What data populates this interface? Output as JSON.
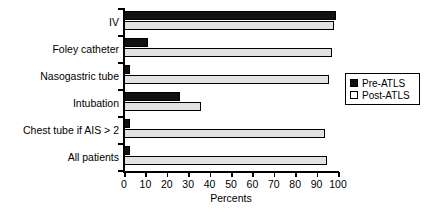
{
  "chart_data": {
    "type": "bar",
    "orientation": "horizontal",
    "title": "",
    "xlabel": "Percents",
    "ylabel": "",
    "xlim": [
      0,
      100
    ],
    "xticks": [
      0,
      10,
      20,
      30,
      40,
      50,
      60,
      70,
      80,
      90,
      100
    ],
    "grid": false,
    "legend_position": "right",
    "categories": [
      "IV",
      "Foley catheter",
      "Nasogastric tube",
      "Intubation",
      "Chest tube if AIS > 2",
      "All patients"
    ],
    "series": [
      {
        "name": "Pre-ATLS",
        "color": "#111111",
        "swatch": "filled",
        "values": [
          99,
          11,
          3,
          26,
          3,
          3
        ]
      },
      {
        "name": "Post-ATLS",
        "color": "#e2e2e2",
        "swatch": "open",
        "values": [
          98,
          97,
          96,
          36,
          94,
          95
        ]
      }
    ]
  },
  "axis": {
    "x_tick_labels": [
      "0",
      "10",
      "20",
      "30",
      "40",
      "50",
      "60",
      "70",
      "80",
      "90",
      "100"
    ],
    "x_title": "Percents"
  },
  "legend": {
    "entries": [
      {
        "label": "Pre-ATLS"
      },
      {
        "label": "Post-ATLS"
      }
    ]
  }
}
